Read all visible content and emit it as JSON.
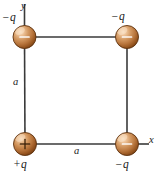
{
  "figure": {
    "background_color": "#ffffff",
    "line_color": "#3a3a3a",
    "text_color": "#1a1a1a",
    "sphere_colors": {
      "highlight": "#f6ddc2",
      "mid": "#c98a4f",
      "shadow": "#8a4e20",
      "edge": "#5e3210"
    }
  },
  "axes": {
    "x_label": "x",
    "y_label": "y"
  },
  "sides": {
    "left_label": "a",
    "bottom_label": "a"
  },
  "charges": [
    {
      "id": "top-left",
      "label": "−q",
      "sign": "−",
      "cx": 24.5,
      "cy": 37,
      "r": 11.5
    },
    {
      "id": "top-right",
      "label": "−q",
      "sign": "−",
      "cx": 127,
      "cy": 37,
      "r": 11.5
    },
    {
      "id": "bottom-left",
      "label": "+q",
      "sign": "+",
      "cx": 25,
      "cy": 144,
      "r": 11.5
    },
    {
      "id": "bottom-right",
      "label": "−q",
      "sign": "−",
      "cx": 127,
      "cy": 144,
      "r": 11.5
    }
  ]
}
